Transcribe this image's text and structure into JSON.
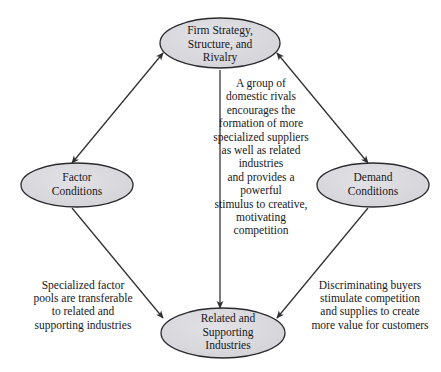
{
  "diagram": {
    "type": "diamond-node-diagram",
    "nodes": [
      {
        "id": "firm-strategy",
        "label": "Firm Strategy,\nStructure, and\nRivalry",
        "position": "top",
        "shape": "ellipse",
        "fill": "#d8d8dc",
        "stroke": "#2a2a2e"
      },
      {
        "id": "factor-conditions",
        "label": "Factor\nConditions",
        "position": "left",
        "shape": "ellipse",
        "fill": "#d8d8dc",
        "stroke": "#2a2a2e"
      },
      {
        "id": "demand-conditions",
        "label": "Demand\nConditions",
        "position": "right",
        "shape": "ellipse",
        "fill": "#d8d8dc",
        "stroke": "#2a2a2e"
      },
      {
        "id": "related-supporting-industries",
        "label": "Related and\nSupporting\nIndustries",
        "position": "bottom",
        "shape": "ellipse",
        "fill": "#d8d8dc",
        "stroke": "#2a2a2e"
      }
    ],
    "connectors": [
      {
        "id": "factor-to-firm",
        "from": "factor-conditions",
        "to": "firm-strategy",
        "arrowheads": "both",
        "caption": ""
      },
      {
        "id": "firm-to-demand",
        "from": "firm-strategy",
        "to": "demand-conditions",
        "arrowheads": "both",
        "caption": ""
      },
      {
        "id": "firm-to-related",
        "from": "firm-strategy",
        "to": "related-supporting-industries",
        "arrowheads": "end",
        "caption": "A group of\ndomestic rivals\nencourages the\nformation of more\nspecialized suppliers\nas well as related\nindustries\nand provides a\npowerful\nstimulus to creative,\nmotivating\ncompetition"
      },
      {
        "id": "factor-to-related",
        "from": "factor-conditions",
        "to": "related-supporting-industries",
        "arrowheads": "end",
        "caption": "Specialized factor\npools are transferable\nto related and\nsupporting industries"
      },
      {
        "id": "demand-to-related",
        "from": "demand-conditions",
        "to": "related-supporting-industries",
        "arrowheads": "end",
        "caption": "Discriminating buyers\nstimulate competition\nand supplies to create\nmore value for customers"
      }
    ],
    "captions": {
      "center": "A group of\ndomestic rivals\nencourages the\nformation of more\nspecialized suppliers\nas well as related\nindustries\nand provides a\npowerful\nstimulus to creative,\nmotivating\ncompetition",
      "left": "Specialized factor\npools are transferable\nto related and\nsupporting industries",
      "right": "Discriminating buyers\nstimulate competition\nand supplies to create\nmore value for customers"
    },
    "colors": {
      "node_fill": "#d8d8dc",
      "node_stroke": "#2a2a2e",
      "connector": "#2e2e33",
      "text": "#17171c",
      "background": "#ffffff"
    }
  }
}
